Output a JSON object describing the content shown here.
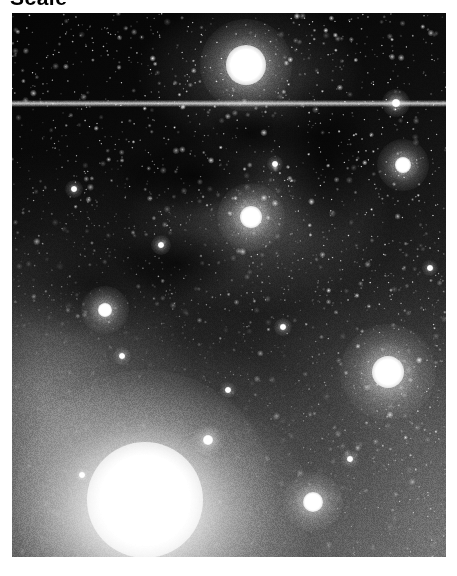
{
  "figure": {
    "caption": "Scale",
    "caption_truncated": true,
    "kind": "astronomical-image",
    "colormap": "grayscale",
    "background_color": "#ffffff",
    "plate_color": "#000000"
  },
  "plate": {
    "x": 12,
    "y": 13,
    "width": 434,
    "height": 544,
    "alt": "Grayscale wide-field astronomical image of a star field with bright reflection nebulosity, dark dust lanes and several saturated stars"
  },
  "artifacts": {
    "scanline": {
      "name": "horizontal-scan-line",
      "y": 90,
      "thickness": 3,
      "brightness": 0.85
    }
  },
  "features": [
    {
      "name": "upper-nebula-knot",
      "x": 234,
      "y": 52,
      "radius": 20,
      "brightness": 1.0,
      "glow": 46
    },
    {
      "name": "central-reflection-nebula",
      "x": 239,
      "y": 204,
      "radius": 11,
      "brightness": 1.0,
      "glow": 34
    },
    {
      "name": "lower-left-bright-complex",
      "x": 133,
      "y": 487,
      "radius": 58,
      "brightness": 1.0,
      "glow": 130
    },
    {
      "name": "bright-star-right",
      "x": 376,
      "y": 359,
      "radius": 16,
      "brightness": 1.0,
      "glow": 48
    },
    {
      "name": "bright-star-lower-right",
      "x": 301,
      "y": 489,
      "radius": 10,
      "brightness": 1.0,
      "glow": 30
    },
    {
      "name": "bright-star-upper-right",
      "x": 391,
      "y": 152,
      "radius": 8,
      "brightness": 1.0,
      "glow": 26
    },
    {
      "name": "bright-star-left",
      "x": 93,
      "y": 297,
      "radius": 7,
      "brightness": 0.95,
      "glow": 24
    },
    {
      "name": "bright-star-top-right-corner",
      "x": 384,
      "y": 90,
      "radius": 4,
      "brightness": 0.95,
      "glow": 14
    },
    {
      "name": "faint-star-a",
      "x": 196,
      "y": 427,
      "radius": 5,
      "brightness": 0.85,
      "glow": 16
    },
    {
      "name": "faint-star-b",
      "x": 149,
      "y": 232,
      "radius": 3,
      "brightness": 0.8,
      "glow": 10
    },
    {
      "name": "faint-star-c",
      "x": 271,
      "y": 314,
      "radius": 3,
      "brightness": 0.75,
      "glow": 9
    },
    {
      "name": "faint-star-d",
      "x": 62,
      "y": 176,
      "radius": 3,
      "brightness": 0.75,
      "glow": 9
    },
    {
      "name": "faint-star-e",
      "x": 338,
      "y": 446,
      "radius": 3,
      "brightness": 0.7,
      "glow": 9
    },
    {
      "name": "faint-star-f",
      "x": 110,
      "y": 343,
      "radius": 3,
      "brightness": 0.72,
      "glow": 9
    },
    {
      "name": "faint-star-g",
      "x": 418,
      "y": 255,
      "radius": 3,
      "brightness": 0.7,
      "glow": 8
    },
    {
      "name": "faint-star-h",
      "x": 263,
      "y": 151,
      "radius": 3,
      "brightness": 0.7,
      "glow": 8
    },
    {
      "name": "faint-star-i",
      "x": 216,
      "y": 377,
      "radius": 3,
      "brightness": 0.68,
      "glow": 8
    },
    {
      "name": "faint-star-j",
      "x": 70,
      "y": 462,
      "radius": 3,
      "brightness": 0.7,
      "glow": 8
    }
  ],
  "starfield": {
    "count": 2600,
    "seed": 20240517,
    "min_radius": 0.35,
    "max_radius": 1.5
  },
  "grain": {
    "seed": 987653,
    "amount": 0.55
  }
}
